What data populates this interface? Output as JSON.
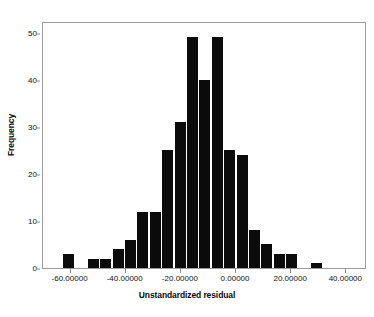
{
  "chart_data": {
    "type": "bar",
    "title": "",
    "subtitle": "",
    "xlabel": "Unstandardized residual",
    "ylabel": "Frequency",
    "grid": false,
    "legend": null,
    "legend_position": "none",
    "bar_color": "#0b0b0b",
    "frame_color": "#9c9c9c",
    "xlim": [
      -70.0,
      47.5
    ],
    "ylim": [
      0,
      52.5
    ],
    "bin_width": 5.0,
    "xtick_labels": [
      "-60.00000",
      "-40.00000",
      "-20.00000",
      "0.00000",
      "20.00000",
      "40.00000"
    ],
    "xtick_values": [
      -60,
      -40,
      -20,
      0,
      20,
      40
    ],
    "ytick_labels": [
      "0",
      "10",
      "20",
      "30",
      "40",
      "50"
    ],
    "ytick_values": [
      0,
      10,
      20,
      30,
      40,
      50
    ],
    "bins": [
      {
        "left": -45.0,
        "right": -40.0,
        "center": -42.5,
        "value": 3
      },
      {
        "left": -40.0,
        "right": -35.0,
        "center": -37.5,
        "value": 0
      },
      {
        "left": -35.0,
        "right": -30.0,
        "center": -32.5,
        "value": 2
      },
      {
        "left": -30.0,
        "right": -25.0,
        "center": -27.5,
        "value": 2
      },
      {
        "left": -25.0,
        "right": -20.0,
        "center": -22.5,
        "value": 4
      },
      {
        "left": -20.0,
        "right": -15.0,
        "center": -17.5,
        "value": 6
      },
      {
        "left": -15.0,
        "right": -10.0,
        "center": -12.5,
        "value": 12
      },
      {
        "left": -10.0,
        "right": -5.0,
        "center": -7.5,
        "value": 12
      },
      {
        "left": -5.0,
        "right": 0.0,
        "center": -2.5,
        "value": 25
      },
      {
        "left": 0.0,
        "right": 5.0,
        "center": 2.5,
        "value": 31
      },
      {
        "left": 5.0,
        "right": 10.0,
        "center": 7.5,
        "value": 49
      },
      {
        "left": 10.0,
        "right": 15.0,
        "center": 12.5,
        "value": 40
      },
      {
        "left": 15.0,
        "right": 20.0,
        "center": 17.5,
        "value": 49
      },
      {
        "left": 20.0,
        "right": 25.0,
        "center": 22.5,
        "value": 25
      },
      {
        "left": 25.0,
        "right": 30.0,
        "center": 27.5,
        "value": 24
      },
      {
        "left": 30.0,
        "right": 35.0,
        "center": 32.5,
        "value": 8
      },
      {
        "left": 35.0,
        "right": 40.0,
        "center": 37.5,
        "value": 5
      },
      {
        "left": 40.0,
        "right": 45.0,
        "center": 42.5,
        "value": 3
      },
      {
        "left": 45.0,
        "right": 50.0,
        "center": 47.5,
        "value": 3
      },
      {
        "left": 50.0,
        "right": 55.0,
        "center": 52.5,
        "value": 0
      },
      {
        "left": 55.0,
        "right": 60.0,
        "center": 57.5,
        "value": 1
      }
    ],
    "categories": [
      "-42.5",
      "-37.5",
      "-32.5",
      "-27.5",
      "-22.5",
      "-17.5",
      "-12.5",
      "-7.5",
      "-2.5",
      "2.5",
      "7.5",
      "12.5",
      "17.5",
      "22.5",
      "27.5",
      "32.5",
      "37.5",
      "42.5",
      "47.5",
      "52.5",
      "57.5"
    ],
    "values": [
      3,
      0,
      2,
      2,
      4,
      6,
      12,
      12,
      25,
      31,
      49,
      40,
      49,
      25,
      24,
      8,
      5,
      3,
      3,
      0,
      1
    ]
  },
  "layout": {
    "plot_left_px": 42,
    "plot_top_px": 22,
    "plot_width_px": 324,
    "plot_height_px": 247,
    "first_bar_left_px": 62,
    "bar_width_px": 11,
    "bar_pitch_px": 12.4,
    "baseline_px": 268,
    "y_unit_px": 4.25,
    "xtick_px": [
      85.5,
      147.0,
      208.5,
      270.0,
      331.5,
      393.0
    ]
  }
}
